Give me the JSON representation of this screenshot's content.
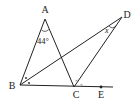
{
  "diagram": {
    "type": "geometry",
    "points": {
      "A": {
        "label": "A",
        "x": 45,
        "y": 19,
        "lx": 45,
        "ly": 13
      },
      "B": {
        "label": "B",
        "x": 20,
        "y": 85,
        "lx": 12,
        "ly": 89
      },
      "C": {
        "label": "C",
        "x": 74,
        "y": 87,
        "lx": 76,
        "ly": 98
      },
      "D": {
        "label": "D",
        "x": 122,
        "y": 17,
        "lx": 127,
        "ly": 18
      },
      "E": {
        "label": "E",
        "x": 101,
        "y": 87,
        "lx": 101,
        "ly": 98
      }
    },
    "segments": [
      "AB",
      "AC",
      "BD",
      "CD",
      "BE-extended"
    ],
    "angle_labels": {
      "A": "44°",
      "D": "x"
    },
    "marks": {
      "B": "bisector dots (•)",
      "C": "bisector crosses (×)"
    },
    "line_color": "#222222"
  }
}
